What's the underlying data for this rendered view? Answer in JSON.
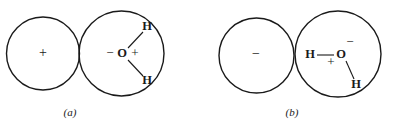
{
  "figure": {
    "width": 396,
    "height": 127,
    "background_color": "#ffffff",
    "ink_color": "#1a1a1a",
    "panels": [
      {
        "id": "a",
        "label": "(a)",
        "label_x": 70,
        "label_y": 113,
        "ion_circle": {
          "cx": 43,
          "cy": 53.5,
          "r": 36.5,
          "charge_symbol": "+",
          "charge_x": 43,
          "charge_y": 54
        },
        "water_circle": {
          "cx": 121.5,
          "cy": 53.5,
          "r": 42.5
        },
        "molecule": {
          "oxygen_label": "O",
          "oxygen_x": 122,
          "oxygen_y": 54,
          "negative_symbol": "−",
          "negative_x": 110,
          "negative_y": 54,
          "positive_symbol": "+",
          "positive_x": 135,
          "positive_y": 54,
          "hydrogens": [
            {
              "label": "H",
              "x": 147,
              "y": 27,
              "bond_x1": 128,
              "bond_y1": 48,
              "bond_x2": 143,
              "bond_y2": 32
            },
            {
              "label": "H",
              "x": 147,
              "y": 81,
              "bond_x1": 128,
              "bond_y1": 60,
              "bond_x2": 143,
              "bond_y2": 76
            }
          ]
        }
      },
      {
        "id": "b",
        "label": "(b)",
        "label_x": 292,
        "label_y": 113,
        "ion_circle": {
          "cx": 256.5,
          "cy": 55.5,
          "r": 37.5,
          "charge_symbol": "−",
          "charge_x": 256,
          "charge_y": 55
        },
        "water_circle": {
          "cx": 338,
          "cy": 54,
          "r": 43
        },
        "molecule": {
          "oxygen_label": "O",
          "oxygen_x": 341,
          "oxygen_y": 55,
          "negative_symbol": "−",
          "negative_x": 350,
          "negative_y": 43,
          "positive_symbol": "+",
          "positive_x": 331,
          "positive_y": 63,
          "hydrogens": [
            {
              "label": "H",
              "x": 310,
              "y": 55,
              "bond_x1": 317,
              "bond_y1": 55,
              "bond_x2": 334,
              "bond_y2": 55
            },
            {
              "label": "H",
              "x": 356,
              "y": 85,
              "bond_x1": 346,
              "bond_y1": 61,
              "bond_x2": 354,
              "bond_y2": 79
            }
          ]
        }
      }
    ]
  }
}
